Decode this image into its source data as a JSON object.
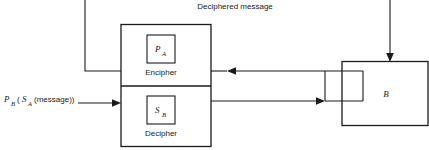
{
  "diagram": {
    "title_label": "Deciphered message",
    "input_label": {
      "outer_key": "P",
      "outer_key_sub": "B",
      "open_paren": "(",
      "inner_key": "S",
      "inner_key_sub": "A",
      "inner_text": "(message))"
    },
    "sender_box": {
      "name": "A",
      "encipher": {
        "key_letter": "P",
        "key_subscript": "A",
        "caption": "Encipher"
      },
      "decipher": {
        "key_letter": "S",
        "key_subscript": "B",
        "caption": "Decipher"
      }
    },
    "receiver_box": {
      "label": "B"
    },
    "connectors": [
      {
        "name": "incoming-ciphertext-to-decipher",
        "direction": "right",
        "description": "input message arrow into Decipher"
      },
      {
        "name": "enciphered-out-to-b",
        "direction": "right",
        "description": "Decipher output line to B"
      },
      {
        "name": "from-b-to-encipher",
        "direction": "left",
        "description": "line from B back into Encipher"
      },
      {
        "name": "deciphered-message-out",
        "direction": "up-left",
        "description": "Encipher feedback to deciphered message"
      },
      {
        "name": "into-b-top",
        "direction": "down",
        "description": "arrow into top of B"
      }
    ],
    "colors": {
      "stroke": "#1a1a1a",
      "background": "#ffffff",
      "text": "#1a1a1a"
    }
  }
}
